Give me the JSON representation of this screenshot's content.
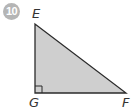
{
  "problem": {
    "number": "10"
  },
  "figure": {
    "shape": "right-triangle",
    "fill_color": "#cfcfcf",
    "stroke_color": "#2b2b2b",
    "vertices": [
      {
        "label": "E",
        "position": "top"
      },
      {
        "label": "G",
        "position": "bottom-left",
        "right_angle": true
      },
      {
        "label": "F",
        "position": "bottom-right"
      }
    ]
  }
}
